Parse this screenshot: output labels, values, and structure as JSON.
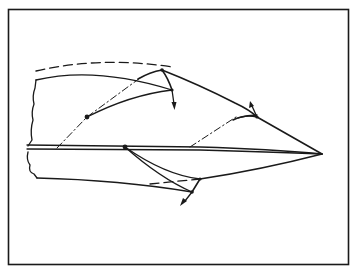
{
  "figure": {
    "line_color": "#1a1a1a",
    "background_color": "#ffffff",
    "frame": {
      "x": 8,
      "y": 9,
      "width": 341,
      "height": 256
    },
    "tip_point": {
      "x": 322,
      "y": 154
    },
    "pivot_points": [
      {
        "name": "upper-left-pivot",
        "x": 87,
        "y": 117
      },
      {
        "name": "upper-flap-hinge",
        "x": 162,
        "y": 70
      },
      {
        "name": "upper-flap-corner",
        "x": 172,
        "y": 90
      },
      {
        "name": "upper-right-hinge",
        "x": 257,
        "y": 117
      },
      {
        "name": "centerline-pivot",
        "x": 125,
        "y": 147
      },
      {
        "name": "lower-flap-hinge",
        "x": 200,
        "y": 179
      },
      {
        "name": "lower-flap-corner",
        "x": 192,
        "y": 192
      }
    ],
    "arrows": [
      {
        "name": "upper-flap-arrow",
        "direction": "down"
      },
      {
        "name": "upper-right-arrow",
        "direction": "up"
      },
      {
        "name": "lower-flap-arrow",
        "direction": "down-left"
      }
    ]
  }
}
